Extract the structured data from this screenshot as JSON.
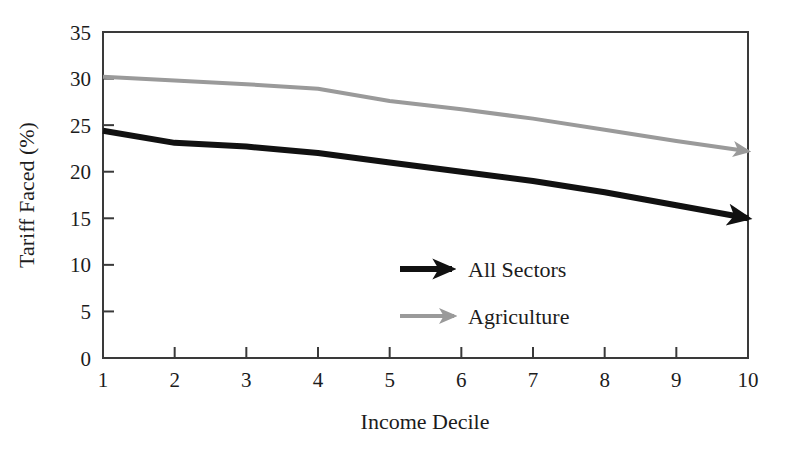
{
  "chart_data": {
    "type": "line",
    "title": "",
    "xlabel": "Income Decile",
    "ylabel": "Tariff Faced (%)",
    "x": [
      1,
      2,
      3,
      4,
      5,
      6,
      7,
      8,
      9,
      10
    ],
    "xlim": [
      1,
      10
    ],
    "ylim": [
      0,
      35
    ],
    "xticks": [
      "1",
      "2",
      "3",
      "4",
      "5",
      "6",
      "7",
      "8",
      "9",
      "10"
    ],
    "yticks": [
      "0",
      "5",
      "10",
      "15",
      "20",
      "25",
      "30",
      "35"
    ],
    "grid": false,
    "legend_position": "center",
    "series": [
      {
        "name": "All Sectors",
        "color": "#111111",
        "width": 6,
        "arrow_end": true,
        "values": [
          24.4,
          23.1,
          22.7,
          22.0,
          21.0,
          20.0,
          19.0,
          17.8,
          16.4,
          15.0
        ]
      },
      {
        "name": "Agriculture",
        "color": "#9a9a9a",
        "width": 4,
        "arrow_end": true,
        "values": [
          30.2,
          29.8,
          29.4,
          28.9,
          27.6,
          26.7,
          25.7,
          24.5,
          23.3,
          22.2
        ]
      }
    ]
  },
  "legend": {
    "entries": [
      {
        "label": "All Sectors",
        "marker": "black-arrow-icon"
      },
      {
        "label": "Agriculture",
        "marker": "gray-arrow-icon"
      }
    ]
  },
  "axes": {
    "x_title": "Income Decile",
    "y_title": "Tariff Faced (%)"
  }
}
